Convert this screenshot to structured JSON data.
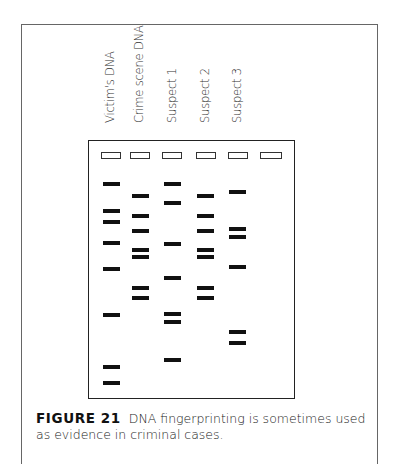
{
  "figure": {
    "label": "FIGURE 21",
    "caption": "DNA fingerprinting is sometimes used as evidence in criminal cases."
  },
  "lanes": [
    {
      "label": "Victim's DNA",
      "label_x": 110,
      "well_x": 101,
      "band_x": 103,
      "bands_y": [
        182,
        209,
        220,
        241,
        267,
        313,
        365,
        381
      ]
    },
    {
      "label": "Crime scene DNA",
      "label_x": 139,
      "well_x": 130,
      "band_x": 132,
      "bands_y": [
        194,
        214,
        229,
        248,
        255,
        286,
        296
      ]
    },
    {
      "label": "Suspect 1",
      "label_x": 172,
      "well_x": 162,
      "band_x": 164,
      "bands_y": [
        182,
        201,
        242,
        276,
        312,
        320,
        358
      ]
    },
    {
      "label": "Suspect 2",
      "label_x": 205,
      "well_x": 196,
      "band_x": 197,
      "bands_y": [
        194,
        214,
        229,
        248,
        255,
        286,
        296
      ]
    },
    {
      "label": "Suspect 3",
      "label_x": 237,
      "well_x": 228,
      "band_x": 229,
      "bands_y": [
        190,
        227,
        235,
        265,
        330,
        341
      ]
    },
    {
      "label": "",
      "label_x": 270,
      "well_x": 260,
      "band_x": 262,
      "bands_y": []
    }
  ],
  "colors": {
    "band": "#111111",
    "gel_border": "#222222",
    "frame_border": "#666666"
  }
}
